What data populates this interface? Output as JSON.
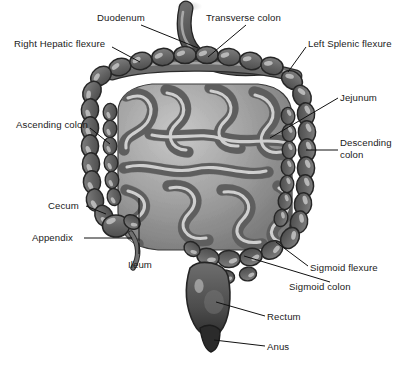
{
  "figure": {
    "style": "grayscale-medical-illustration",
    "width": 405,
    "height": 365,
    "background_color": "#ffffff"
  },
  "palette": {
    "outline": "#2a2a2a",
    "colon_dark": "#595959",
    "colon_mid": "#6e6e6e",
    "colon_light": "#8c8c8c",
    "haustra_highlight": "#d8d8d8",
    "small_intestine_mid": "#9a9a9a",
    "small_intestine_light": "#cfcfcf",
    "small_intestine_shadow": "#6b6b6b",
    "duodenum": "#4a4a4a",
    "anus_dark": "#333333",
    "label_text": "#1a1a1a",
    "leader_line": "#111111"
  },
  "labels": [
    {
      "id": "duodenum",
      "text": "Duodenum",
      "x": 97,
      "y": 16,
      "align": "left"
    },
    {
      "id": "transverse-colon",
      "text": "Transverse colon",
      "x": 206,
      "y": 16,
      "align": "left"
    },
    {
      "id": "right-hepatic-flexure",
      "text": "Right Hepatic flexure",
      "x": 14,
      "y": 38,
      "align": "left"
    },
    {
      "id": "left-splenic-flexure",
      "text": "Left Splenic flexure",
      "x": 308,
      "y": 38,
      "align": "left"
    },
    {
      "id": "jejunum",
      "text": "Jejunum",
      "x": 340,
      "y": 92,
      "align": "left"
    },
    {
      "id": "ascending-colon",
      "text": "Ascending colon",
      "x": 16,
      "y": 119,
      "align": "left"
    },
    {
      "id": "descending-colon",
      "text": "Descending\ncolon",
      "x": 340,
      "y": 137,
      "align": "left"
    },
    {
      "id": "cecum",
      "text": "Cecum",
      "x": 48,
      "y": 200,
      "align": "left"
    },
    {
      "id": "appendix",
      "text": "Appendix",
      "x": 32,
      "y": 232,
      "align": "left"
    },
    {
      "id": "ileum",
      "text": "Ileum",
      "x": 128,
      "y": 259,
      "align": "left"
    },
    {
      "id": "sigmoid-flexure",
      "text": "Sigmoid flexure",
      "x": 310,
      "y": 262,
      "align": "left"
    },
    {
      "id": "sigmoid-colon",
      "text": "Sigmoid colon",
      "x": 289,
      "y": 281,
      "align": "left"
    },
    {
      "id": "rectum",
      "text": "Rectum",
      "x": 267,
      "y": 311,
      "align": "left"
    },
    {
      "id": "anus",
      "text": "Anus",
      "x": 267,
      "y": 341,
      "align": "left"
    }
  ],
  "anatomy_parts": [
    {
      "id": "duodenum",
      "name": "Duodenum",
      "region": "upper-center",
      "description": "dark C-shaped tube descending from top center"
    },
    {
      "id": "transverse-colon",
      "name": "Transverse colon",
      "region": "top",
      "description": "horizontal haustrated band across the top"
    },
    {
      "id": "hepatic-flexure",
      "name": "Right Hepatic flexure",
      "region": "upper-left",
      "description": "right-angle bend joining ascending and transverse colon"
    },
    {
      "id": "splenic-flexure",
      "name": "Left Splenic flexure",
      "region": "upper-right",
      "description": "bend joining transverse and descending colon"
    },
    {
      "id": "ascending-colon",
      "name": "Ascending colon",
      "region": "left",
      "description": "vertical haustrated column on the left side"
    },
    {
      "id": "descending-colon",
      "name": "Descending colon",
      "region": "right",
      "description": "vertical haustrated column on the right side"
    },
    {
      "id": "jejunum",
      "name": "Jejunum",
      "region": "center",
      "description": "coiled small intestine loops, upper portion"
    },
    {
      "id": "ileum",
      "name": "Ileum",
      "region": "center-lower",
      "description": "coiled small intestine loops, lower portion"
    },
    {
      "id": "cecum",
      "name": "Cecum",
      "region": "lower-left",
      "description": "pouch at the junction of ileum and ascending colon"
    },
    {
      "id": "appendix",
      "name": "Appendix",
      "region": "lower-left",
      "description": "thin curved tail projecting from the cecum"
    },
    {
      "id": "sigmoid-flexure",
      "name": "Sigmoid flexure",
      "region": "lower-right",
      "description": "S-shaped bend of the sigmoid colon"
    },
    {
      "id": "sigmoid-colon",
      "name": "Sigmoid colon",
      "region": "lower-center",
      "description": "S-shaped segment leading to the rectum"
    },
    {
      "id": "rectum",
      "name": "Rectum",
      "region": "bottom-center",
      "description": "wide terminal pouch below the sigmoid colon"
    },
    {
      "id": "anus",
      "name": "Anus",
      "region": "bottom-center",
      "description": "dark narrow terminal opening"
    }
  ]
}
